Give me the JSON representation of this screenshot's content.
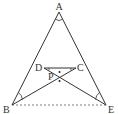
{
  "figure": {
    "type": "geometry-diagram",
    "points": {
      "A": {
        "label": "A",
        "x": 59,
        "y": 12
      },
      "B": {
        "label": "B",
        "x": 12,
        "y": 105
      },
      "E": {
        "label": "E",
        "x": 106,
        "y": 105
      },
      "D": {
        "label": "D",
        "x": 44,
        "y": 68
      },
      "C": {
        "label": "C",
        "x": 76,
        "y": 68
      },
      "P": {
        "label": "P",
        "x": 60,
        "y": 77
      }
    },
    "segments": [
      "AB",
      "AE",
      "DC",
      "BC",
      "ED"
    ],
    "dashed_segments": [
      "BE"
    ],
    "angle_marks": [
      "A",
      "B",
      "E",
      "D",
      "C"
    ],
    "dot_marks": 2,
    "line_color": "#333333"
  }
}
